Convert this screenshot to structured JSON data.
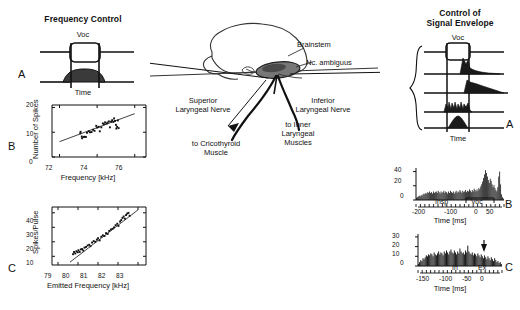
{
  "figure": {
    "background_color": "#ffffff",
    "ink_color": "#111111"
  },
  "left_panel": {
    "title": "Frequency Control",
    "panel_letter": "A",
    "voc_label": "Voc",
    "time_label": "Time"
  },
  "right_panel": {
    "title_line1": "Control of",
    "title_line2": "Signal Envelope",
    "panel_letter": "A",
    "voc_label": "Voc",
    "time_label": "Time"
  },
  "anatomy": {
    "labels": [
      {
        "name": "brainstem",
        "text": "Brainstem"
      },
      {
        "name": "nucleus-ambiguus",
        "text": "Nc. ambiguus"
      },
      {
        "name": "superior-laryngeal-nerve",
        "line1": "Superior",
        "line2": "Laryngeal Nerve"
      },
      {
        "name": "inferior-laryngeal-nerve",
        "line1": "Inferior",
        "line2": "Laryngeal Nerve"
      },
      {
        "name": "to-cricothyroid-muscle",
        "line1": "to Cricothyroid",
        "line2": "Muscle"
      },
      {
        "name": "to-inner-laryngeal-muscles",
        "line1": "to Inner",
        "line2": "Laryngeal",
        "line3": "Muscles"
      }
    ]
  },
  "chart_data": [
    {
      "id": "plot-b-left",
      "panel_letter": "B",
      "type": "scatter",
      "title": "",
      "xlabel": "Frequency [kHz]",
      "ylabel": "Number of Spikes",
      "xlim": [
        71.6,
        76.6
      ],
      "ylim": [
        0,
        21
      ],
      "xticks": [
        72,
        74,
        76
      ],
      "yticks": [
        0,
        10,
        20
      ],
      "grid": false,
      "points": [
        {
          "x": 73.1,
          "y": 9.6
        },
        {
          "x": 73.12,
          "y": 10.2
        },
        {
          "x": 73.18,
          "y": 8.3
        },
        {
          "x": 73.2,
          "y": 7.6
        },
        {
          "x": 73.28,
          "y": 8.1
        },
        {
          "x": 73.34,
          "y": 8.2
        },
        {
          "x": 73.4,
          "y": 8.1
        },
        {
          "x": 73.46,
          "y": 9.8
        },
        {
          "x": 73.55,
          "y": 10.4
        },
        {
          "x": 73.62,
          "y": 10.0
        },
        {
          "x": 73.7,
          "y": 10.1
        },
        {
          "x": 73.78,
          "y": 11.0
        },
        {
          "x": 73.86,
          "y": 10.6
        },
        {
          "x": 73.95,
          "y": 12.6
        },
        {
          "x": 74.0,
          "y": 11.9
        },
        {
          "x": 74.08,
          "y": 12.2
        },
        {
          "x": 74.14,
          "y": 10.4
        },
        {
          "x": 74.22,
          "y": 12.0
        },
        {
          "x": 74.3,
          "y": 13.6
        },
        {
          "x": 74.36,
          "y": 13.2
        },
        {
          "x": 74.42,
          "y": 14.0
        },
        {
          "x": 74.5,
          "y": 13.5
        },
        {
          "x": 74.55,
          "y": 13.9
        },
        {
          "x": 74.62,
          "y": 14.4
        },
        {
          "x": 74.68,
          "y": 12.0
        },
        {
          "x": 74.74,
          "y": 14.3
        },
        {
          "x": 74.8,
          "y": 14.9
        },
        {
          "x": 74.86,
          "y": 14.2
        },
        {
          "x": 74.9,
          "y": 15.6
        },
        {
          "x": 74.95,
          "y": 14.6
        },
        {
          "x": 75.0,
          "y": 13.0
        },
        {
          "x": 75.02,
          "y": 11.5
        },
        {
          "x": 75.06,
          "y": 12.2
        },
        {
          "x": 75.1,
          "y": 14.8
        },
        {
          "x": 75.14,
          "y": 11.7
        }
      ],
      "fit_line": {
        "x1": 72.0,
        "y1": 6.2,
        "x2": 76.0,
        "y2": 17.5
      }
    },
    {
      "id": "plot-c-left",
      "panel_letter": "C",
      "type": "scatter",
      "title": "",
      "xlabel": "Emitted Frequency [kHz]",
      "ylabel": "Spikes/Pulse",
      "xlim": [
        78.7,
        83.4
      ],
      "ylim": [
        4,
        44
      ],
      "xticks": [
        79,
        80,
        81,
        82,
        83
      ],
      "yticks": [
        10,
        20,
        30,
        40
      ],
      "grid": false,
      "points": [
        {
          "x": 79.75,
          "y": 11.5
        },
        {
          "x": 79.8,
          "y": 13.0
        },
        {
          "x": 79.86,
          "y": 12.0
        },
        {
          "x": 79.92,
          "y": 13.5
        },
        {
          "x": 79.98,
          "y": 12.8
        },
        {
          "x": 80.02,
          "y": 14.2
        },
        {
          "x": 80.08,
          "y": 13.0
        },
        {
          "x": 80.14,
          "y": 14.8
        },
        {
          "x": 80.2,
          "y": 15.0
        },
        {
          "x": 80.26,
          "y": 14.0
        },
        {
          "x": 80.32,
          "y": 16.0
        },
        {
          "x": 80.4,
          "y": 16.5
        },
        {
          "x": 80.48,
          "y": 17.5
        },
        {
          "x": 80.56,
          "y": 18.0
        },
        {
          "x": 80.62,
          "y": 17.0
        },
        {
          "x": 80.7,
          "y": 19.5
        },
        {
          "x": 80.78,
          "y": 20.5
        },
        {
          "x": 80.86,
          "y": 20.0
        },
        {
          "x": 80.94,
          "y": 21.5
        },
        {
          "x": 81.0,
          "y": 22.5
        },
        {
          "x": 81.08,
          "y": 21.0
        },
        {
          "x": 81.16,
          "y": 23.5
        },
        {
          "x": 81.24,
          "y": 24.5
        },
        {
          "x": 81.32,
          "y": 24.0
        },
        {
          "x": 81.4,
          "y": 26.0
        },
        {
          "x": 81.48,
          "y": 25.5
        },
        {
          "x": 81.56,
          "y": 27.5
        },
        {
          "x": 81.64,
          "y": 28.5
        },
        {
          "x": 81.72,
          "y": 29.0
        },
        {
          "x": 81.8,
          "y": 30.0
        },
        {
          "x": 81.88,
          "y": 31.5
        },
        {
          "x": 81.96,
          "y": 32.5
        },
        {
          "x": 82.02,
          "y": 31.0
        },
        {
          "x": 82.1,
          "y": 34.0
        },
        {
          "x": 82.16,
          "y": 35.0
        },
        {
          "x": 82.22,
          "y": 36.5
        },
        {
          "x": 82.28,
          "y": 37.5
        },
        {
          "x": 82.34,
          "y": 36.0
        },
        {
          "x": 82.4,
          "y": 38.5
        },
        {
          "x": 82.46,
          "y": 39.5
        },
        {
          "x": 82.52,
          "y": 40.0
        },
        {
          "x": 82.58,
          "y": 38.0
        }
      ],
      "fit_line": {
        "x1": 79.6,
        "y1": 6.0,
        "x2": 83.0,
        "y2": 42.0
      }
    },
    {
      "id": "histogram-b-right",
      "panel_letter": "B",
      "type": "bar",
      "title": "",
      "xlabel": "Time [ms]",
      "ylabel": "",
      "xlim": [
        -250,
        60
      ],
      "ylim": [
        0,
        45
      ],
      "xticks": [
        -200,
        -100,
        0,
        50
      ],
      "yticks": [
        0,
        20,
        40
      ],
      "grid": false,
      "annotations": [
        {
          "name": "insp-bracket-label",
          "text": "Insp"
        },
        {
          "name": "voc-bracket-label",
          "text": "Voc"
        }
      ],
      "values": [
        3,
        4,
        5,
        6,
        5,
        7,
        6,
        8,
        9,
        8,
        10,
        9,
        11,
        10,
        12,
        10,
        11,
        9,
        12,
        10,
        11,
        12,
        10,
        13,
        11,
        9,
        12,
        10,
        11,
        13,
        10,
        12,
        11,
        9,
        12,
        10,
        13,
        11,
        10,
        12,
        9,
        11,
        13,
        10,
        12,
        11,
        14,
        12,
        10,
        13,
        11,
        12,
        14,
        11,
        13,
        12,
        15,
        13,
        11,
        14,
        12,
        16,
        14,
        12,
        15,
        13,
        17,
        15,
        19,
        22,
        26,
        31,
        36,
        42,
        38,
        33,
        28,
        24,
        30,
        27,
        22,
        18,
        21,
        17,
        14,
        12,
        18,
        33,
        40,
        22,
        8,
        4,
        2
      ]
    },
    {
      "id": "histogram-c-right",
      "panel_letter": "C",
      "type": "bar",
      "title": "",
      "xlabel": "Time [ms]",
      "ylabel": "",
      "xlim": [
        -175,
        15
      ],
      "ylim": [
        0,
        33
      ],
      "xticks": [
        -150,
        -100,
        -50,
        0
      ],
      "yticks": [
        0,
        10,
        20,
        30
      ],
      "grid": false,
      "annotations": [
        {
          "name": "inspiration-label",
          "text": "In"
        },
        {
          "name": "expiration-label",
          "text": "Ex"
        },
        {
          "name": "event-marker-arrow",
          "text": ""
        }
      ],
      "values": [
        2,
        4,
        6,
        5,
        8,
        7,
        9,
        11,
        10,
        12,
        11,
        13,
        12,
        10,
        14,
        12,
        11,
        13,
        15,
        12,
        14,
        13,
        11,
        15,
        13,
        16,
        14,
        12,
        15,
        17,
        14,
        13,
        16,
        14,
        12,
        15,
        13,
        18,
        15,
        13,
        14,
        12,
        16,
        14,
        21,
        15,
        13,
        12,
        14,
        11,
        13,
        12,
        10,
        13,
        11,
        9,
        12,
        10,
        8,
        11,
        9,
        7,
        10,
        8,
        6,
        9,
        7,
        5,
        8,
        6,
        4,
        5,
        3,
        4,
        2
      ]
    }
  ]
}
